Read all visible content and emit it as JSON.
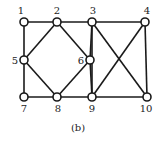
{
  "diagram": {
    "caption": "(b)",
    "nodes": [
      {
        "id": "1",
        "x": 24,
        "y": 22,
        "label_x": 21,
        "label_y": 14,
        "anchor": "middle"
      },
      {
        "id": "2",
        "x": 57,
        "y": 22,
        "label_x": 57,
        "label_y": 14,
        "anchor": "middle"
      },
      {
        "id": "3",
        "x": 92,
        "y": 22,
        "label_x": 93,
        "label_y": 14,
        "anchor": "middle"
      },
      {
        "id": "4",
        "x": 145,
        "y": 22,
        "label_x": 147,
        "label_y": 14,
        "anchor": "middle"
      },
      {
        "id": "5",
        "x": 24,
        "y": 60,
        "label_x": 15,
        "label_y": 64,
        "anchor": "middle"
      },
      {
        "id": "6",
        "x": 90,
        "y": 60,
        "label_x": 81,
        "label_y": 64,
        "anchor": "middle"
      },
      {
        "id": "7",
        "x": 24,
        "y": 97,
        "label_x": 24,
        "label_y": 112,
        "anchor": "middle"
      },
      {
        "id": "8",
        "x": 57,
        "y": 97,
        "label_x": 58,
        "label_y": 112,
        "anchor": "middle"
      },
      {
        "id": "9",
        "x": 92,
        "y": 97,
        "label_x": 92,
        "label_y": 112,
        "anchor": "middle"
      },
      {
        "id": "10",
        "x": 147,
        "y": 97,
        "label_x": 146,
        "label_y": 112,
        "anchor": "middle"
      }
    ],
    "edges": [
      [
        "1",
        "2"
      ],
      [
        "2",
        "3"
      ],
      [
        "3",
        "4"
      ],
      [
        "1",
        "5"
      ],
      [
        "5",
        "7"
      ],
      [
        "7",
        "8"
      ],
      [
        "8",
        "9"
      ],
      [
        "9",
        "10"
      ],
      [
        "2",
        "5"
      ],
      [
        "2",
        "6"
      ],
      [
        "5",
        "8"
      ],
      [
        "6",
        "8"
      ],
      [
        "3",
        "6"
      ],
      [
        "6",
        "9"
      ],
      [
        "3",
        "9"
      ],
      [
        "4",
        "10"
      ],
      [
        "3",
        "10"
      ],
      [
        "4",
        "9"
      ]
    ],
    "colors": {
      "stroke": "#1a1a1a",
      "node_fill": "#ffffff",
      "text": "#222222"
    }
  }
}
